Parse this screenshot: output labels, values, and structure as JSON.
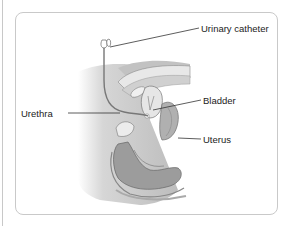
{
  "figure": {
    "type": "anatomical-illustration",
    "labels": [
      {
        "id": "catheter",
        "text": "Urinary catheter"
      },
      {
        "id": "urethra",
        "text": "Urethra"
      },
      {
        "id": "bladder",
        "text": "Bladder"
      },
      {
        "id": "uterus",
        "text": "Uterus"
      }
    ],
    "colors": {
      "frame_border": "#c9c9c9",
      "label_text": "#222222",
      "leader_line": "#333333",
      "tissue_dark": "#8c8c8c",
      "tissue_mid": "#b4b4b4",
      "tissue_light": "#dedede"
    }
  }
}
